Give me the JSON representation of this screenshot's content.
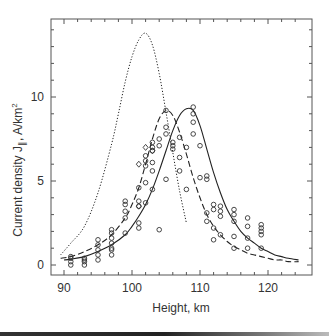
{
  "chart_data": {
    "type": "line",
    "title": "",
    "xlabel": "Height, km",
    "ylabel": "Current density J",
    "ylabel_sub": "∥",
    "ylabel_unit": ", A/km",
    "ylabel_sup": "2",
    "xlim": [
      88,
      126
    ],
    "ylim": [
      -0.6,
      14.6
    ],
    "xticks": [
      90,
      100,
      110,
      120
    ],
    "yticks": [
      0,
      5,
      10
    ],
    "grid": false,
    "legend": null,
    "series": [
      {
        "name": "dotted-model",
        "style": "dotted",
        "x": [
          89.5,
          91,
          93,
          95,
          97,
          98,
          99,
          100,
          101,
          102,
          103,
          104,
          105,
          106,
          107,
          108
        ],
        "y": [
          0.6,
          1.3,
          2.3,
          4.3,
          7.2,
          9.0,
          10.9,
          12.4,
          13.4,
          13.8,
          13.1,
          11.4,
          9.1,
          6.7,
          4.4,
          2.5
        ]
      },
      {
        "name": "dashed-fit",
        "style": "dashed",
        "x": [
          89.5,
          91,
          93,
          95,
          97,
          99,
          100,
          101,
          102,
          103,
          104,
          105,
          106,
          107,
          108,
          109,
          110,
          111,
          112,
          113,
          114,
          115,
          116,
          117,
          118,
          119,
          120,
          121,
          122,
          123,
          124.5
        ],
        "y": [
          0.4,
          0.5,
          0.8,
          1.2,
          1.8,
          2.8,
          3.6,
          4.6,
          6.0,
          7.5,
          8.7,
          9.2,
          8.9,
          7.9,
          6.6,
          5.2,
          4.0,
          3.0,
          2.3,
          1.8,
          1.4,
          1.1,
          0.9,
          0.7,
          0.6,
          0.5,
          0.4,
          0.3,
          0.3,
          0.2,
          0.2
        ]
      },
      {
        "name": "solid-fit",
        "style": "solid",
        "x": [
          90,
          91,
          93,
          95,
          97,
          99,
          100,
          101,
          102,
          103,
          104,
          105,
          106,
          107,
          108,
          109,
          110,
          111,
          112,
          113,
          114,
          115,
          116,
          117,
          118,
          119,
          120,
          121,
          122,
          123,
          124.5
        ],
        "y": [
          0.3,
          0.35,
          0.5,
          0.8,
          1.2,
          1.8,
          2.3,
          2.9,
          3.6,
          4.5,
          5.6,
          6.8,
          8.0,
          8.9,
          9.3,
          9.2,
          8.3,
          6.9,
          5.5,
          4.3,
          3.3,
          2.6,
          2.0,
          1.6,
          1.3,
          1.0,
          0.8,
          0.6,
          0.5,
          0.4,
          0.3
        ]
      }
    ],
    "scatter_points": {
      "marker": "open-circle",
      "x": [
        91,
        91,
        91,
        91,
        93,
        93,
        93,
        93,
        95,
        95,
        95,
        95,
        95,
        97,
        97,
        97,
        97,
        97,
        97,
        97,
        99,
        99,
        99,
        99,
        99,
        101,
        101,
        101,
        101,
        101,
        102,
        102,
        102,
        102,
        102,
        103,
        103,
        103,
        103,
        103,
        103,
        104,
        104,
        104,
        105,
        105,
        105,
        105,
        106,
        106,
        106,
        107,
        107,
        107,
        108,
        108,
        109,
        109,
        109,
        109,
        110,
        110,
        111,
        111,
        111,
        111,
        112,
        112,
        112,
        112,
        113,
        113,
        113,
        113,
        115,
        115,
        115,
        115,
        115,
        117,
        117,
        117,
        117,
        119,
        119,
        119,
        119,
        119
      ],
      "y": [
        0.0,
        0.2,
        0.4,
        0.5,
        0.0,
        0.2,
        0.3,
        0.4,
        0.6,
        0.9,
        1.2,
        1.5,
        0.3,
        1.6,
        1.9,
        2.1,
        1.0,
        1.3,
        0.6,
        0.9,
        2.8,
        3.2,
        3.6,
        3.8,
        1.9,
        3.5,
        3.8,
        2.2,
        2.5,
        4.6,
        4.9,
        5.9,
        6.2,
        6.5,
        3.7,
        5.6,
        6.1,
        6.8,
        7.0,
        7.3,
        4.5,
        7.1,
        7.5,
        2.1,
        7.8,
        8.2,
        9.2,
        5.1,
        7.1,
        7.3,
        6.9,
        7.6,
        6.4,
        5.6,
        7.0,
        4.5,
        8.5,
        9.0,
        9.4,
        7.8,
        7.1,
        5.2,
        5.3,
        5.1,
        3.1,
        2.6,
        3.3,
        3.6,
        1.5,
        2.2,
        3.2,
        3.5,
        2.9,
        1.8,
        3.3,
        3.0,
        2.6,
        1.7,
        1.0,
        2.8,
        2.3,
        1.6,
        1.0,
        2.4,
        2.2,
        2.0,
        1.8,
        1.0
      ]
    },
    "diamond_points": {
      "marker": "open-diamond",
      "x": [
        101,
        101,
        102,
        103
      ],
      "y": [
        3.5,
        6.0,
        7.0,
        6.8
      ]
    }
  }
}
